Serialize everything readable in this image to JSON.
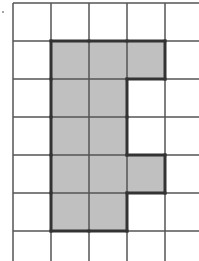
{
  "diagram": {
    "type": "grid-shape",
    "grid": {
      "origin_x": 13,
      "origin_y": 3,
      "cell_size": 38,
      "columns": 5,
      "rows": 7,
      "line_color": "#555555",
      "background": "#ffffff"
    },
    "shaded_cells": [
      [
        1,
        1
      ],
      [
        1,
        2
      ],
      [
        1,
        3
      ],
      [
        2,
        1
      ],
      [
        2,
        2
      ],
      [
        3,
        1
      ],
      [
        3,
        2
      ],
      [
        4,
        1
      ],
      [
        4,
        2
      ],
      [
        4,
        3
      ],
      [
        5,
        1
      ],
      [
        5,
        2
      ]
    ],
    "shade_color": "#c0c0c0",
    "outline_color": "#333333"
  }
}
